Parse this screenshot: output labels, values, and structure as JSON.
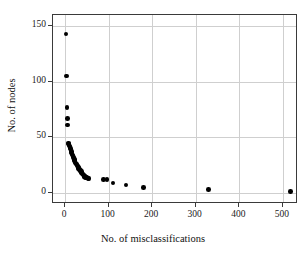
{
  "chart_data": {
    "type": "scatter",
    "title": "",
    "xlabel": "No. of misclassifications",
    "ylabel": "No. of nodes",
    "xlim": [
      -28,
      535
    ],
    "ylim": [
      -10,
      160
    ],
    "xticks": [
      0,
      100,
      200,
      300,
      400,
      500
    ],
    "yticks": [
      0,
      50,
      100,
      150
    ],
    "xtick_labels": [
      "0",
      "100",
      "200",
      "300",
      "400",
      "500"
    ],
    "ytick_labels": [
      "0",
      "50",
      "100",
      "150"
    ],
    "grid": true,
    "legend": "none",
    "marker": "filled-circle",
    "marker_color": "#000000",
    "grid_color": "#cfcfcf",
    "frame_color": "#3a3a3a",
    "background": "#ffffff",
    "points": [
      {
        "x": 2,
        "y": 143
      },
      {
        "x": 3,
        "y": 105
      },
      {
        "x": 4,
        "y": 77
      },
      {
        "x": 5,
        "y": 67
      },
      {
        "x": 6,
        "y": 61
      },
      {
        "x": 7,
        "y": 45
      },
      {
        "x": 8,
        "y": 44
      },
      {
        "x": 9,
        "y": 43
      },
      {
        "x": 10,
        "y": 42
      },
      {
        "x": 11,
        "y": 41
      },
      {
        "x": 12,
        "y": 40
      },
      {
        "x": 13,
        "y": 38
      },
      {
        "x": 14,
        "y": 37
      },
      {
        "x": 15,
        "y": 36
      },
      {
        "x": 16,
        "y": 35
      },
      {
        "x": 17,
        "y": 34
      },
      {
        "x": 18,
        "y": 33
      },
      {
        "x": 19,
        "y": 32
      },
      {
        "x": 20,
        "y": 31
      },
      {
        "x": 21,
        "y": 30
      },
      {
        "x": 22,
        "y": 29
      },
      {
        "x": 23,
        "y": 28
      },
      {
        "x": 24,
        "y": 27
      },
      {
        "x": 25,
        "y": 26
      },
      {
        "x": 26,
        "y": 26
      },
      {
        "x": 27,
        "y": 25
      },
      {
        "x": 28,
        "y": 24
      },
      {
        "x": 29,
        "y": 24
      },
      {
        "x": 30,
        "y": 23
      },
      {
        "x": 31,
        "y": 22
      },
      {
        "x": 32,
        "y": 22
      },
      {
        "x": 33,
        "y": 21
      },
      {
        "x": 34,
        "y": 20
      },
      {
        "x": 35,
        "y": 20
      },
      {
        "x": 36,
        "y": 19
      },
      {
        "x": 37,
        "y": 19
      },
      {
        "x": 38,
        "y": 18
      },
      {
        "x": 39,
        "y": 18
      },
      {
        "x": 40,
        "y": 17
      },
      {
        "x": 41,
        "y": 17
      },
      {
        "x": 42,
        "y": 16
      },
      {
        "x": 43,
        "y": 16
      },
      {
        "x": 44,
        "y": 15
      },
      {
        "x": 45,
        "y": 15
      },
      {
        "x": 46,
        "y": 15
      },
      {
        "x": 47,
        "y": 14
      },
      {
        "x": 48,
        "y": 14
      },
      {
        "x": 50,
        "y": 14
      },
      {
        "x": 52,
        "y": 13
      },
      {
        "x": 55,
        "y": 13
      },
      {
        "x": 88,
        "y": 12
      },
      {
        "x": 96,
        "y": 12
      },
      {
        "x": 110,
        "y": 9
      },
      {
        "x": 140,
        "y": 7
      },
      {
        "x": 180,
        "y": 5
      },
      {
        "x": 330,
        "y": 3
      },
      {
        "x": 518,
        "y": 1
      }
    ]
  }
}
